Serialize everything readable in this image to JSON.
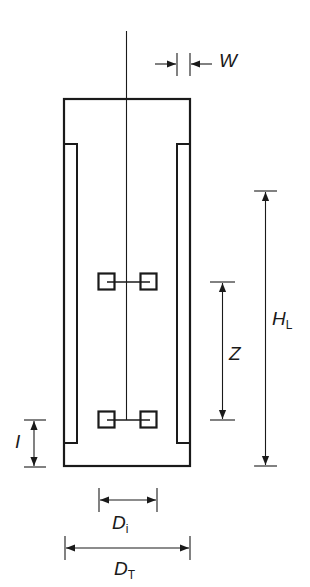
{
  "diagram": {
    "colors": {
      "stroke": "#1a1a1a",
      "background": "#ffffff"
    },
    "components": [
      {
        "id": "tank",
        "type": "vessel",
        "description": "Open-top cylindrical tank (cross-section)"
      },
      {
        "id": "baffle-left",
        "type": "baffle"
      },
      {
        "id": "baffle-right",
        "type": "baffle"
      },
      {
        "id": "shaft",
        "type": "shaft",
        "description": "Central agitator shaft"
      },
      {
        "id": "impeller-upper",
        "type": "impeller"
      },
      {
        "id": "impeller-lower",
        "type": "impeller"
      }
    ],
    "labels": {
      "W": {
        "main": "W",
        "sub": ""
      },
      "HL": {
        "main": "H",
        "sub": "L"
      },
      "Z": {
        "main": "Z",
        "sub": ""
      },
      "I": {
        "main": "I",
        "sub": ""
      },
      "Di": {
        "main": "D",
        "sub": "i"
      },
      "DT": {
        "main": "D",
        "sub": "T"
      }
    },
    "dimensions": [
      {
        "symbol": "W",
        "meaning": "baffle width"
      },
      {
        "symbol": "H_L",
        "meaning": "liquid height"
      },
      {
        "symbol": "Z",
        "meaning": "impeller spacing"
      },
      {
        "symbol": "I",
        "meaning": "impeller clearance from bottom"
      },
      {
        "symbol": "D_i",
        "meaning": "impeller diameter"
      },
      {
        "symbol": "D_T",
        "meaning": "tank diameter"
      }
    ]
  }
}
